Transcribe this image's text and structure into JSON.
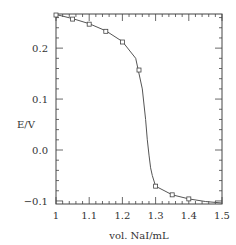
{
  "chart_data": {
    "type": "scatter",
    "title": "",
    "xlabel": "vol. NaI/mL",
    "ylabel": "E/V",
    "xlim": [
      1.0,
      1.5
    ],
    "ylim": [
      -0.106,
      0.267
    ],
    "xticks": [
      1,
      1.1,
      1.2,
      1.3,
      1.4,
      1.5
    ],
    "xtick_labels": [
      "1",
      "1.1",
      "1.2",
      "1.3",
      "1.4",
      "1.5"
    ],
    "yticks": [
      -0.1,
      0.0,
      0.1,
      0.2
    ],
    "ytick_labels": [
      "−0.1",
      "0.0",
      "0.1",
      "0.2"
    ],
    "grid": false,
    "legend": null,
    "series": [
      {
        "name": "measured",
        "marker": "open-square",
        "x": [
          1.0,
          1.05,
          1.1,
          1.15,
          1.2,
          1.25,
          1.3,
          1.35,
          1.4
        ],
        "y": [
          0.265,
          0.257,
          0.247,
          0.233,
          0.212,
          0.157,
          -0.071,
          -0.088,
          -0.096
        ]
      },
      {
        "name": "fit curve",
        "line": "solid",
        "x": [
          1.0,
          1.05,
          1.1,
          1.15,
          1.2,
          1.24,
          1.26,
          1.27,
          1.275,
          1.28,
          1.285,
          1.29,
          1.3,
          1.35,
          1.4,
          1.45,
          1.5
        ],
        "y": [
          0.266,
          0.258,
          0.248,
          0.234,
          0.213,
          0.18,
          0.12,
          0.06,
          0.02,
          -0.01,
          -0.035,
          -0.05,
          -0.071,
          -0.088,
          -0.096,
          -0.101,
          -0.104
        ]
      }
    ]
  }
}
